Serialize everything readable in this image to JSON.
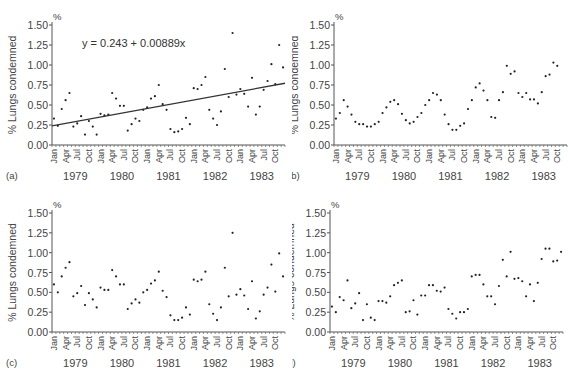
{
  "chart_data": [
    {
      "panel": "(a)",
      "type": "scatter",
      "title": "",
      "xlabel": "",
      "ylabel": "% Lungs condemned",
      "y_unit": "%",
      "ylim": [
        0,
        1.5
      ],
      "yticks": [
        "0.00",
        "0.25",
        "0.50",
        "0.75",
        "1.00",
        "1.25",
        "1.50"
      ],
      "month_ticks": [
        "Jan",
        "Apr",
        "Jul",
        "Oct"
      ],
      "years": [
        "1979",
        "1980",
        "1981",
        "1982",
        "1983"
      ],
      "annotation": "y = 0.243 + 0.00889x",
      "trend_line": {
        "intercept": 0.243,
        "slope": 0.00889
      },
      "values": [
        0.33,
        0.24,
        0.45,
        0.56,
        0.65,
        0.23,
        0.27,
        0.36,
        0.13,
        0.3,
        0.23,
        0.13,
        0.39,
        0.37,
        0.38,
        0.65,
        0.58,
        0.49,
        0.49,
        0.18,
        0.26,
        0.33,
        0.3,
        0.44,
        0.47,
        0.58,
        0.61,
        0.75,
        0.51,
        0.44,
        0.2,
        0.16,
        0.17,
        0.2,
        0.34,
        0.26,
        0.71,
        0.7,
        0.75,
        0.85,
        0.44,
        0.33,
        0.25,
        0.42,
        0.95,
        0.6,
        1.4,
        0.63,
        0.7,
        0.64,
        0.48,
        0.84,
        0.38,
        0.48,
        0.69,
        0.8,
        1.01,
        0.76,
        1.25,
        0.97
      ]
    },
    {
      "panel": "(b)",
      "type": "scatter",
      "ylabel": "% Lungs condemned",
      "y_unit": "%",
      "ylim": [
        0,
        1.5
      ],
      "yticks": [
        "0.00",
        "0.25",
        "0.50",
        "0.75",
        "1.00",
        "1.25",
        "1.50"
      ],
      "month_ticks": [
        "Jan",
        "Apr",
        "Jul",
        "Oct"
      ],
      "years": [
        "1979",
        "1980",
        "1981",
        "1982",
        "1983"
      ],
      "values": [
        0.33,
        0.4,
        0.56,
        0.48,
        0.38,
        0.29,
        0.26,
        0.26,
        0.23,
        0.23,
        0.26,
        0.29,
        0.4,
        0.47,
        0.54,
        0.56,
        0.51,
        0.39,
        0.31,
        0.27,
        0.29,
        0.35,
        0.4,
        0.5,
        0.56,
        0.65,
        0.63,
        0.56,
        0.38,
        0.26,
        0.19,
        0.19,
        0.24,
        0.27,
        0.45,
        0.56,
        0.72,
        0.77,
        0.68,
        0.56,
        0.35,
        0.34,
        0.56,
        0.66,
        0.99,
        0.89,
        0.92,
        0.65,
        0.6,
        0.65,
        0.57,
        0.57,
        0.52,
        0.66,
        0.86,
        0.88,
        1.03,
        0.99
      ]
    },
    {
      "panel": "(c)",
      "type": "scatter",
      "ylabel": "% Lungs condemned",
      "y_unit": "%",
      "ylim": [
        0,
        1.5
      ],
      "yticks": [
        "0.00",
        "0.25",
        "0.50",
        "0.75",
        "1.00",
        "1.25",
        "1.50"
      ],
      "month_ticks": [
        "Jan",
        "Apr",
        "Jul",
        "Oct"
      ],
      "years": [
        "1979",
        "1980",
        "1981",
        "1982",
        "1983"
      ],
      "values": [
        0.6,
        0.5,
        0.7,
        0.81,
        0.88,
        0.45,
        0.49,
        0.58,
        0.34,
        0.49,
        0.41,
        0.31,
        0.56,
        0.53,
        0.53,
        0.78,
        0.7,
        0.6,
        0.6,
        0.29,
        0.36,
        0.41,
        0.37,
        0.5,
        0.53,
        0.61,
        0.65,
        0.76,
        0.52,
        0.44,
        0.21,
        0.15,
        0.15,
        0.18,
        0.31,
        0.22,
        0.66,
        0.64,
        0.66,
        0.76,
        0.35,
        0.23,
        0.15,
        0.31,
        0.81,
        0.45,
        1.25,
        0.47,
        0.54,
        0.46,
        0.29,
        0.64,
        0.17,
        0.26,
        0.47,
        0.56,
        0.85,
        0.51,
        0.99,
        0.7
      ]
    },
    {
      "panel": "(d)",
      "type": "scatter",
      "ylabel": "% Lungs condemned",
      "y_unit": "%",
      "ylim": [
        0,
        1.5
      ],
      "yticks": [
        "0.00",
        "0.25",
        "0.50",
        "0.75",
        "1.00",
        "1.25",
        "1.50"
      ],
      "month_ticks": [
        "Jan",
        "Apr",
        "Jul",
        "Oct"
      ],
      "years": [
        "1979",
        "1980",
        "1981",
        "1982",
        "1983"
      ],
      "values": [
        0.32,
        0.25,
        0.44,
        0.4,
        0.65,
        0.3,
        0.36,
        0.49,
        0.15,
        0.35,
        0.18,
        0.15,
        0.39,
        0.39,
        0.37,
        0.45,
        0.59,
        0.62,
        0.65,
        0.25,
        0.26,
        0.4,
        0.22,
        0.46,
        0.46,
        0.59,
        0.59,
        0.52,
        0.51,
        0.56,
        0.29,
        0.23,
        0.17,
        0.25,
        0.25,
        0.29,
        0.7,
        0.72,
        0.72,
        0.6,
        0.45,
        0.45,
        0.35,
        0.58,
        0.91,
        0.7,
        1.01,
        0.67,
        0.68,
        0.64,
        0.45,
        0.6,
        0.39,
        0.62,
        0.92,
        1.05,
        1.05,
        0.89,
        0.9,
        1.01
      ]
    }
  ],
  "panels": [
    {
      "label": "(a)",
      "ylabel": "% Lungs condemned",
      "unit": "%",
      "equation": "y = 0.243 + 0.00889x"
    },
    {
      "label": "(b)",
      "ylabel": "% Lungs condemned",
      "unit": "%"
    },
    {
      "label": "(c)",
      "ylabel": "% Lungs condemned",
      "unit": "%"
    },
    {
      "label": "(d)",
      "ylabel": "% Lungs condemned",
      "unit": "%"
    }
  ]
}
